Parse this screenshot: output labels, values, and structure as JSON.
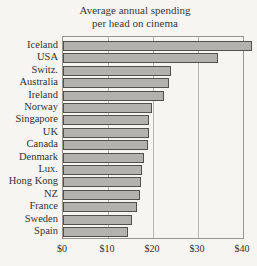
{
  "page": {
    "background_color": "#f6f5f2",
    "bar_fill_color": "#b3b2ae",
    "bar_border_color": "#52524c",
    "axis_border_color": "#97978f",
    "gridline_color": "#b9b9b4",
    "text_color": "#33332f"
  },
  "chart_data": {
    "type": "bar",
    "orientation": "horizontal",
    "title": "Average annual spending per head on cinema",
    "title_lines": [
      "Average annual spending",
      "per head on cinema"
    ],
    "categories": [
      "Iceland",
      "USA",
      "Switz.",
      "Australia",
      "Ireland",
      "Norway",
      "Singapore",
      "UK",
      "Canada",
      "Denmark",
      "Lux.",
      "Hong Kong",
      "NZ",
      "France",
      "Sweden",
      "Spain"
    ],
    "values": [
      42,
      34.5,
      24,
      23.5,
      22.5,
      19.8,
      19.2,
      19,
      18.9,
      18,
      17.5,
      17.3,
      17,
      16.5,
      15.3,
      14.5
    ],
    "value_unit": "$",
    "xlabel": "",
    "ylabel": "",
    "x_ticks": [
      "$0",
      "$10",
      "$20",
      "$30",
      "$40"
    ],
    "x_tick_values": [
      0,
      10,
      20,
      30,
      40
    ],
    "xlim": [
      0,
      40
    ],
    "grid": true,
    "legend": "none",
    "note": "Iceland bar extends slightly beyond the $40 plot boundary"
  }
}
